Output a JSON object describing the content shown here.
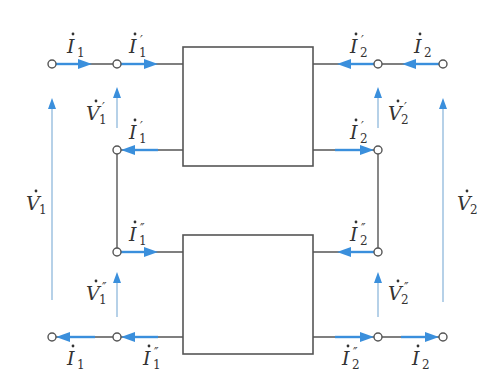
{
  "diagram": {
    "colors": {
      "wire": "#555555",
      "current_arrow": "#3a8fdc",
      "voltage_arrow": "#8fb8dc",
      "text": "#333333"
    },
    "networks": [
      {
        "id": "upper",
        "x": 183,
        "y": 47,
        "w": 130,
        "h": 119
      },
      {
        "id": "lower",
        "x": 183,
        "y": 235,
        "w": 130,
        "h": 119
      }
    ],
    "labels": {
      "I1_top": {
        "base": "I",
        "sub": "1",
        "prime": ""
      },
      "I1p_top": {
        "base": "I",
        "sub": "1",
        "prime": "′"
      },
      "I2p_top": {
        "base": "I",
        "sub": "2",
        "prime": "′"
      },
      "I2_top": {
        "base": "I",
        "sub": "2",
        "prime": ""
      },
      "V1p": {
        "base": "V",
        "sub": "1",
        "prime": "′"
      },
      "V2p": {
        "base": "V",
        "sub": "2",
        "prime": "′"
      },
      "I1p_mid": {
        "base": "I",
        "sub": "1",
        "prime": "′"
      },
      "I2p_mid": {
        "base": "I",
        "sub": "2",
        "prime": "′"
      },
      "V1": {
        "base": "V",
        "sub": "1",
        "prime": ""
      },
      "V2": {
        "base": "V",
        "sub": "2",
        "prime": ""
      },
      "I1pp_mid": {
        "base": "I",
        "sub": "1",
        "prime": "″"
      },
      "I2pp_mid": {
        "base": "I",
        "sub": "2",
        "prime": "″"
      },
      "V1pp": {
        "base": "V",
        "sub": "1",
        "prime": "″"
      },
      "V2pp": {
        "base": "V",
        "sub": "2",
        "prime": "″"
      },
      "I1_bot": {
        "base": "I",
        "sub": "1",
        "prime": ""
      },
      "I1pp_bot": {
        "base": "I",
        "sub": "1",
        "prime": "″"
      },
      "I2pp_bot": {
        "base": "I",
        "sub": "2",
        "prime": "″"
      },
      "I2_bot": {
        "base": "I",
        "sub": "2",
        "prime": ""
      }
    }
  }
}
